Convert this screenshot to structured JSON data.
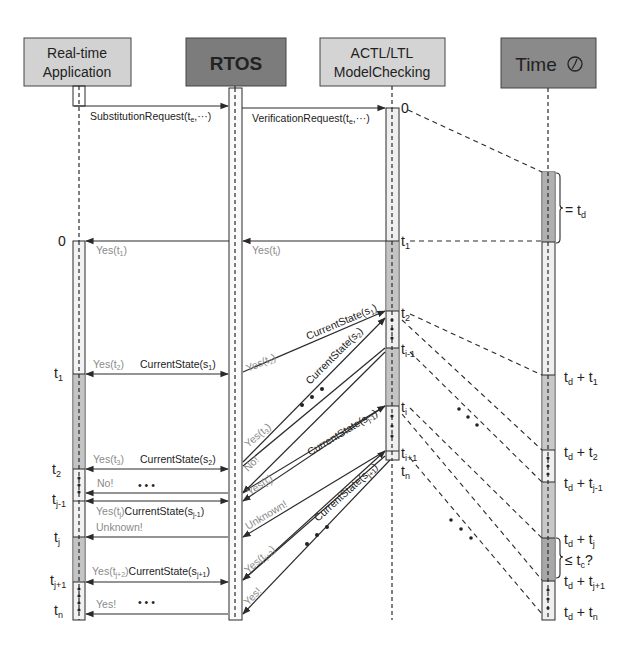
{
  "participants": [
    {
      "id": "app",
      "line1": "Real-time",
      "line2": "Application",
      "fill": "#d2d2d2"
    },
    {
      "id": "rtos",
      "label": "RTOS",
      "fill": "#7c7c7c"
    },
    {
      "id": "mc",
      "line1": "ACTL/LTL",
      "line2": "ModelChecking",
      "fill": "#d4d4d4"
    },
    {
      "id": "time",
      "label": "Time",
      "fill": "#8a8a8a",
      "icon": "clock-icon"
    }
  ],
  "messages": {
    "substitution_request": "SubstitutionRequest(t",
    "substitution_sub": "e",
    "substitution_tail": ",···)",
    "verification_request": "VerificationRequest(t",
    "verification_sub": "e",
    "verification_tail": ",···)",
    "yes_t1": "Yes(t",
    "yes_t1_sub": "1",
    "yes_ti_rtos": "Yes(t",
    "yes_ti_rtos_sub": "i",
    "current_state": "CurrentState(s",
    "yes_t2": "Yes(t",
    "yes_t2_sub": "2",
    "cs_s1": "s",
    "cs_s1_sub": "1",
    "yes_t3": "Yes(t",
    "yes_t3_sub": "3",
    "cs_s2_sub": "2",
    "no": "No!",
    "yes_tj": "Yes(t",
    "yes_tj_sub": "j",
    "cs_sj1_sub": "j-1",
    "unknown": "Unknown!",
    "yes_tj2": "Yes(t",
    "yes_tj2_sub": "j+2",
    "cs_sj1p_sub": "j+1",
    "yes_end": "Yes!",
    "ellipsis": "• • •",
    "close_paren": ")"
  },
  "app_ticks": [
    {
      "label": "0",
      "sub": ""
    },
    {
      "label": "t",
      "sub": "1"
    },
    {
      "label": "t",
      "sub": "2"
    },
    {
      "label": "t",
      "sub": "j-1"
    },
    {
      "label": "t",
      "sub": "j"
    },
    {
      "label": "t",
      "sub": "j+1"
    },
    {
      "label": "t",
      "sub": "n"
    }
  ],
  "mc_ticks": [
    {
      "label": "0",
      "sub": ""
    },
    {
      "label": "t",
      "sub": "1"
    },
    {
      "label": "t",
      "sub": "2"
    },
    {
      "label": "t",
      "sub": "i-1"
    },
    {
      "label": "t",
      "sub": "i"
    },
    {
      "label": "t",
      "sub": "i+1"
    },
    {
      "label": "t",
      "sub": "n"
    }
  ],
  "time_ticks": [
    {
      "label": "= t",
      "sub": "d"
    },
    {
      "label": "t",
      "sub": "d",
      "plus": " + t",
      "sub2": "1"
    },
    {
      "label": "t",
      "sub": "d",
      "plus": " + t",
      "sub2": "2"
    },
    {
      "label": "t",
      "sub": "d",
      "plus": " + t",
      "sub2": "j-1"
    },
    {
      "label": "t",
      "sub": "d",
      "plus": " + t",
      "sub2": "j"
    },
    {
      "label": "≤ t",
      "sub": "c",
      "tail": "?"
    },
    {
      "label": "t",
      "sub": "d",
      "plus": " + t",
      "sub2": "j+1"
    },
    {
      "label": "t",
      "sub": "d",
      "plus": " + t",
      "sub2": "n"
    }
  ],
  "colors": {
    "line": "#2b2b2b",
    "activation_light": "#e8e8e8",
    "activation_dark": "#b4b4b4",
    "gray_text": "#8a8a8a"
  }
}
